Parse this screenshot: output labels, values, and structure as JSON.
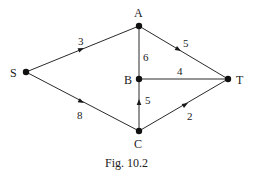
{
  "figure": {
    "caption": "Fig. 10.2",
    "colors": {
      "line": "#2a2a2a",
      "node": "#111111",
      "background": "#ffffff"
    }
  },
  "nodes": [
    {
      "id": "S",
      "label": "S",
      "x": 26,
      "y": 72
    },
    {
      "id": "A",
      "label": "A",
      "x": 139,
      "y": 26
    },
    {
      "id": "B",
      "label": "B",
      "x": 139,
      "y": 79
    },
    {
      "id": "C",
      "label": "C",
      "x": 139,
      "y": 131
    },
    {
      "id": "T",
      "label": "T",
      "x": 228,
      "y": 79
    }
  ],
  "edges": [
    {
      "from": "S",
      "to": "A",
      "weight": "3",
      "directed": true
    },
    {
      "from": "A",
      "to": "T",
      "weight": "5",
      "directed": true
    },
    {
      "from": "A",
      "to": "B",
      "weight": "6",
      "directed": false
    },
    {
      "from": "B",
      "to": "T",
      "weight": "4",
      "directed": false
    },
    {
      "from": "C",
      "to": "B",
      "weight": "5",
      "directed": true
    },
    {
      "from": "S",
      "to": "C",
      "weight": "8",
      "directed": true
    },
    {
      "from": "C",
      "to": "T",
      "weight": "2",
      "directed": true
    }
  ]
}
